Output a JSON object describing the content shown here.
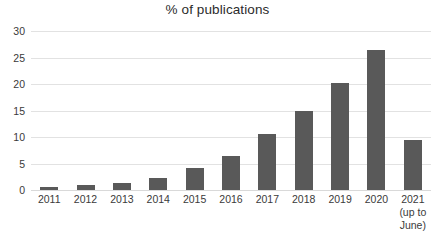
{
  "chart_data": {
    "type": "bar",
    "title": "% of publications",
    "xlabel": "",
    "ylabel": "",
    "ylim": [
      0,
      30
    ],
    "yticks": [
      0,
      5,
      10,
      15,
      20,
      25,
      30
    ],
    "grid": true,
    "legend": null,
    "bar_color": "#595959",
    "categories": [
      "2011",
      "2012",
      "2013",
      "2014",
      "2015",
      "2016",
      "2017",
      "2018",
      "2019",
      "2020",
      "2021"
    ],
    "category_sublabels": [
      "",
      "",
      "",
      "",
      "",
      "",
      "",
      "",
      "",
      "",
      "(up to\nJune)"
    ],
    "values": [
      0.5,
      0.9,
      1.3,
      2.2,
      4.2,
      6.5,
      10.5,
      15.0,
      20.2,
      26.5,
      9.5
    ]
  },
  "axis": {
    "tick_labels": [
      "0",
      "5",
      "10",
      "15",
      "20",
      "25",
      "30"
    ]
  },
  "xaxis": {
    "labels": [
      {
        "year": "2011",
        "sub1": "",
        "sub2": ""
      },
      {
        "year": "2012",
        "sub1": "",
        "sub2": ""
      },
      {
        "year": "2013",
        "sub1": "",
        "sub2": ""
      },
      {
        "year": "2014",
        "sub1": "",
        "sub2": ""
      },
      {
        "year": "2015",
        "sub1": "",
        "sub2": ""
      },
      {
        "year": "2016",
        "sub1": "",
        "sub2": ""
      },
      {
        "year": "2017",
        "sub1": "",
        "sub2": ""
      },
      {
        "year": "2018",
        "sub1": "",
        "sub2": ""
      },
      {
        "year": "2019",
        "sub1": "",
        "sub2": ""
      },
      {
        "year": "2020",
        "sub1": "",
        "sub2": ""
      },
      {
        "year": "2021",
        "sub1": "(up to",
        "sub2": "June)"
      }
    ]
  }
}
